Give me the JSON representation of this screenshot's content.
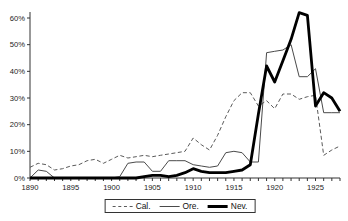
{
  "chart_data": {
    "type": "line",
    "title": "",
    "xlabel": "",
    "ylabel": "",
    "grid": false,
    "legend_position": "bottom",
    "x_start": 1890,
    "x_end": 1928,
    "x": [
      1890,
      1891,
      1892,
      1893,
      1894,
      1895,
      1896,
      1897,
      1898,
      1899,
      1900,
      1901,
      1902,
      1903,
      1904,
      1905,
      1906,
      1907,
      1908,
      1909,
      1910,
      1911,
      1912,
      1913,
      1914,
      1915,
      1916,
      1917,
      1918,
      1919,
      1920,
      1921,
      1922,
      1923,
      1924,
      1925,
      1926,
      1927,
      1928
    ],
    "x_tick_labels": [
      "1890",
      "1895",
      "1900",
      "1905",
      "1910",
      "1915",
      "1920",
      "1925"
    ],
    "x_tick_years": [
      1890,
      1895,
      1900,
      1905,
      1910,
      1915,
      1920,
      1925
    ],
    "ylim": [
      0,
      65
    ],
    "y_ticks": [
      0,
      10,
      20,
      30,
      40,
      50,
      60
    ],
    "y_tick_labels": [
      "0%",
      "10%",
      "20%",
      "30%",
      "40%",
      "50%",
      "60%"
    ],
    "series": [
      {
        "name": "Cal.",
        "style": "dashed",
        "color": "#5a5a5a",
        "width": 1,
        "values": [
          4,
          5.5,
          5,
          3,
          3.5,
          4.5,
          5,
          6.5,
          7,
          5.5,
          7,
          8.5,
          7.5,
          8,
          8.5,
          8,
          8.5,
          9,
          9.5,
          10,
          15,
          12.5,
          10.5,
          16,
          23,
          29,
          32,
          32,
          27,
          29,
          26,
          31.5,
          31.5,
          29.5,
          30.5,
          31,
          8.5,
          10.5,
          12
        ]
      },
      {
        "name": "Ore.",
        "style": "solid",
        "color": "#4a4a4a",
        "width": 1,
        "values": [
          0,
          3,
          2.5,
          0,
          0,
          0,
          0,
          0,
          0,
          0,
          0,
          0.5,
          5.5,
          6,
          6,
          2.5,
          2.5,
          6.5,
          6.5,
          6.5,
          5,
          4.5,
          4,
          4.5,
          9.5,
          10,
          9.5,
          6,
          6,
          47,
          47.5,
          48,
          50,
          38,
          38,
          41,
          24.5,
          24.5,
          24.5
        ]
      },
      {
        "name": "Nev.",
        "style": "solid-thick",
        "color": "#000000",
        "width": 2.8,
        "values": [
          0,
          0,
          0,
          0,
          0,
          0,
          0,
          0,
          0,
          0,
          0,
          0,
          0,
          0,
          0.5,
          1,
          1,
          0.5,
          1,
          2,
          3.5,
          2.5,
          2,
          2,
          2,
          2.5,
          3,
          5,
          24,
          42,
          36,
          44,
          52,
          62,
          61,
          27,
          32,
          30,
          25
        ]
      }
    ]
  },
  "legend": {
    "items": [
      {
        "label": "Cal."
      },
      {
        "label": "Ore."
      },
      {
        "label": "Nev."
      }
    ]
  }
}
